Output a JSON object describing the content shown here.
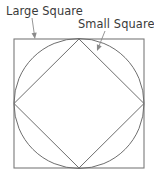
{
  "figure": {
    "background_color": "#ffffff",
    "stroke_color": "#6e6e6e",
    "label_color": "#3a3a3a",
    "leader_color": "#8a8a8a",
    "labels": [
      {
        "id": "large-square",
        "text": "Large Square",
        "x": 6,
        "y": 15,
        "leader": {
          "from_x": 32,
          "from_y": 18,
          "to_x": 35,
          "to_y": 39
        }
      },
      {
        "id": "small-square",
        "text": "Small Square",
        "x": 78,
        "y": 28,
        "leader": {
          "from_x": 105,
          "from_y": 31,
          "to_x": 97,
          "to_y": 51
        }
      }
    ],
    "shapes": {
      "outer_square": {
        "name": "Large Square",
        "x": 14,
        "y": 39,
        "width": 130,
        "height": 129
      },
      "circle": {
        "name": "Circle",
        "cx": 79,
        "cy": 103.5,
        "r": 65
      },
      "inner_square": {
        "name": "Small Square",
        "points": "79,39 144,103.5 79,168 14,103.5"
      }
    }
  }
}
